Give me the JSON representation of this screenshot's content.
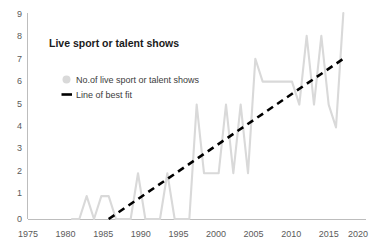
{
  "chart_data": {
    "type": "line",
    "title": "Live sport or talent shows",
    "xlabel": "",
    "ylabel": "",
    "xlim": [
      1975,
      2020
    ],
    "ylim": [
      0,
      9
    ],
    "grid": false,
    "legend_position": "upper-left",
    "x_ticks": [
      "1975",
      "1980",
      "1985",
      "1990",
      "1995",
      "2000",
      "2005",
      "2010",
      "2015",
      "2020"
    ],
    "y_ticks": [
      "0",
      "1",
      "2",
      "3",
      "4",
      "5",
      "6",
      "7",
      "8",
      "9"
    ],
    "legend": [
      {
        "label": "No.of live sport or talent shows",
        "marker": "circle",
        "color": "#d9d9d9"
      },
      {
        "label": "Line of best fit",
        "marker": "dash",
        "color": "#000000"
      }
    ],
    "series": [
      {
        "name": "No.of live sport or talent shows",
        "type": "line",
        "color": "#d9d9d9",
        "x": [
          1981,
          1982,
          1983,
          1984,
          1985,
          1986,
          1987,
          1988,
          1989,
          1990,
          1991,
          1992,
          1993,
          1994,
          1995,
          1996,
          1997,
          1998,
          1999,
          2000,
          2001,
          2002,
          2003,
          2004,
          2005,
          2006,
          2007,
          2008,
          2009,
          2010,
          2011,
          2012,
          2013,
          2014,
          2015,
          2016,
          2017,
          2018
        ],
        "values": [
          0,
          0,
          1,
          0,
          1,
          1,
          0,
          0,
          0,
          2,
          0,
          0,
          0,
          2,
          0,
          0,
          0,
          5,
          2,
          2,
          2,
          5,
          2,
          5,
          2,
          7,
          6,
          6,
          6,
          6,
          6,
          5,
          8,
          5,
          8,
          5,
          4,
          9
        ]
      },
      {
        "name": "Line of best fit",
        "type": "line",
        "color": "#000000",
        "style": "dashed",
        "x": [
          1986,
          2018
        ],
        "values": [
          0,
          7
        ]
      }
    ]
  }
}
